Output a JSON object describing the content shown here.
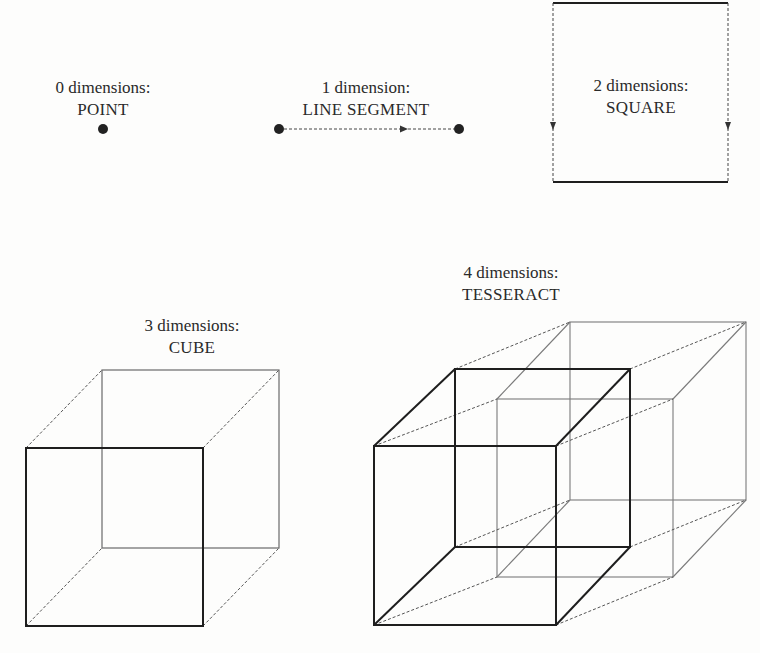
{
  "diagram": {
    "stages": [
      {
        "dimensions_label": "0 dimensions:",
        "name": "POINT"
      },
      {
        "dimensions_label": "1 dimension:",
        "name": "LINE SEGMENT"
      },
      {
        "dimensions_label": "2 dimensions:",
        "name": "SQUARE"
      },
      {
        "dimensions_label": "3 dimensions:",
        "name": "CUBE"
      },
      {
        "dimensions_label": "4 dimensions:",
        "name": "TESSERACT"
      }
    ],
    "colors": {
      "solid_edge": "#1e1e1e",
      "faded_edge": "#777777",
      "dashed_edge": "#555555",
      "text": "#2a2a2a"
    }
  }
}
